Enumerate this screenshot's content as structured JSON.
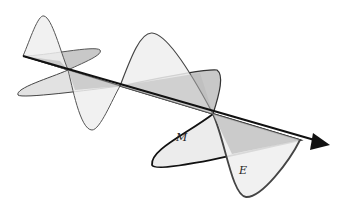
{
  "diagram": {
    "labels": {
      "magnetic": "M",
      "electric": "E"
    },
    "colors": {
      "background": "#ffffff",
      "axis": "#111111",
      "wave_stroke": "#444444",
      "light_fill": "#efefef",
      "dark_fill": "#c4c4c4"
    }
  }
}
